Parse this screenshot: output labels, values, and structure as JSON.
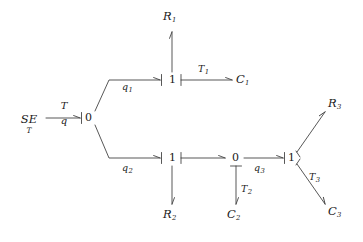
{
  "diagram": {
    "stroke_color": "#3a3a3a",
    "text_color": "#1a1a1a",
    "background": "#ffffff",
    "source": {
      "symbol": "SE",
      "subscript": "T"
    },
    "root_edge": {
      "numerator": "T",
      "denominator": "q"
    },
    "nodes": [
      {
        "id": "root",
        "label": "0"
      },
      {
        "id": "upper",
        "label": "1"
      },
      {
        "id": "lower",
        "label": "1"
      },
      {
        "id": "mid",
        "label": "0"
      },
      {
        "id": "right",
        "label": "1"
      }
    ],
    "edge_labels": [
      {
        "id": "q1",
        "base": "q",
        "sub": "1"
      },
      {
        "id": "q2",
        "base": "q",
        "sub": "2"
      },
      {
        "id": "q3",
        "base": "q",
        "sub": "3"
      },
      {
        "id": "T1",
        "base": "T",
        "sub": "1"
      },
      {
        "id": "T2",
        "base": "T",
        "sub": "2"
      },
      {
        "id": "T3",
        "base": "T",
        "sub": "3"
      }
    ],
    "terminals": [
      {
        "id": "R1",
        "base": "R",
        "sub": "1"
      },
      {
        "id": "C1",
        "base": "C",
        "sub": "1"
      },
      {
        "id": "R2",
        "base": "R",
        "sub": "2"
      },
      {
        "id": "C2",
        "base": "C",
        "sub": "2"
      },
      {
        "id": "R3",
        "base": "R",
        "sub": "3"
      },
      {
        "id": "C3",
        "base": "C",
        "sub": "3"
      }
    ]
  }
}
